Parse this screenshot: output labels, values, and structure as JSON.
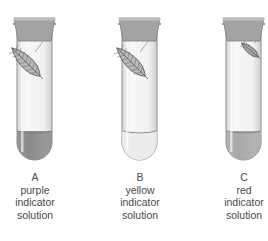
{
  "tubes": [
    {
      "letter": "A",
      "color_word": "purple",
      "line2": "indicator",
      "line3": "solution",
      "liquid_fill": "#8a8a8a",
      "leaf_size": "large"
    },
    {
      "letter": "B",
      "color_word": "yellow",
      "line2": "indicator",
      "line3": "solution",
      "liquid_fill": "#ececec",
      "leaf_size": "large"
    },
    {
      "letter": "C",
      "color_word": "red",
      "line2": "indicator",
      "line3": "solution",
      "liquid_fill": "#a9a9a9",
      "leaf_size": "small"
    }
  ]
}
